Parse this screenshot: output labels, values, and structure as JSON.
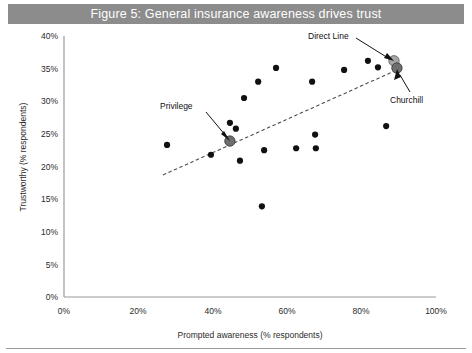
{
  "title": "Figure 5: General insurance awareness drives trust",
  "colors": {
    "title_banner_bg": "#8c8c8c",
    "title_text": "#ffffff",
    "point": "#111111",
    "highlight_light": "#a6a6a6",
    "highlight_dark": "#6e6e6e",
    "axis": "#9a9a9a",
    "trendline": "#4d4d4d",
    "background": "#ffffff"
  },
  "chart_data": {
    "type": "scatter",
    "title": "Figure 5: General insurance awareness drives trust",
    "xlabel": "Prompted awareness (% respondents)",
    "ylabel": "Trustworthy (% respondents)",
    "xlim": [
      0,
      100
    ],
    "ylim": [
      0,
      40
    ],
    "xticks": [
      "0%",
      "20%",
      "40%",
      "60%",
      "80%",
      "100%"
    ],
    "xtick_values": [
      0,
      20,
      40,
      60,
      80,
      100
    ],
    "yticks": [
      "0%",
      "5%",
      "10%",
      "15%",
      "20%",
      "25%",
      "30%",
      "35%",
      "40%"
    ],
    "ytick_values": [
      0,
      5,
      10,
      15,
      20,
      25,
      30,
      35,
      40
    ],
    "grid": false,
    "legend": "none",
    "points": [
      {
        "x": 27.7,
        "y": 23.3,
        "label": "",
        "kind": "normal"
      },
      {
        "x": 39.5,
        "y": 21.8,
        "label": "",
        "kind": "normal"
      },
      {
        "x": 44.6,
        "y": 23.9,
        "label": "Privilege",
        "kind": "highlight-dark"
      },
      {
        "x": 44.6,
        "y": 26.7,
        "label": "",
        "kind": "normal"
      },
      {
        "x": 46.2,
        "y": 25.8,
        "label": "",
        "kind": "normal"
      },
      {
        "x": 47.3,
        "y": 20.9,
        "label": "",
        "kind": "normal"
      },
      {
        "x": 48.4,
        "y": 30.5,
        "label": "",
        "kind": "normal"
      },
      {
        "x": 52.2,
        "y": 33.0,
        "label": "",
        "kind": "normal"
      },
      {
        "x": 53.2,
        "y": 13.9,
        "label": "",
        "kind": "normal"
      },
      {
        "x": 53.8,
        "y": 22.5,
        "label": "",
        "kind": "normal"
      },
      {
        "x": 57.0,
        "y": 35.1,
        "label": "",
        "kind": "normal"
      },
      {
        "x": 62.4,
        "y": 22.8,
        "label": "",
        "kind": "normal"
      },
      {
        "x": 66.7,
        "y": 33.0,
        "label": "",
        "kind": "normal"
      },
      {
        "x": 67.5,
        "y": 24.9,
        "label": "",
        "kind": "normal"
      },
      {
        "x": 67.7,
        "y": 22.8,
        "label": "",
        "kind": "normal"
      },
      {
        "x": 75.3,
        "y": 34.8,
        "label": "",
        "kind": "normal"
      },
      {
        "x": 81.7,
        "y": 36.2,
        "label": "",
        "kind": "normal"
      },
      {
        "x": 84.4,
        "y": 35.2,
        "label": "",
        "kind": "normal"
      },
      {
        "x": 86.6,
        "y": 26.2,
        "label": "",
        "kind": "normal"
      },
      {
        "x": 88.7,
        "y": 36.2,
        "label": "Direct Line",
        "kind": "highlight-light"
      },
      {
        "x": 89.5,
        "y": 35.1,
        "label": "Churchill",
        "kind": "highlight-dark"
      }
    ],
    "trendline": {
      "x0": 26.6,
      "y0": 18.7,
      "x1": 89.5,
      "y1": 34.8,
      "style": "dashed"
    },
    "annotations": [
      {
        "text": "Privilege",
        "target": "Privilege"
      },
      {
        "text": "Direct Line",
        "target": "Direct Line"
      },
      {
        "text": "Churchill",
        "target": "Churchill"
      }
    ]
  }
}
